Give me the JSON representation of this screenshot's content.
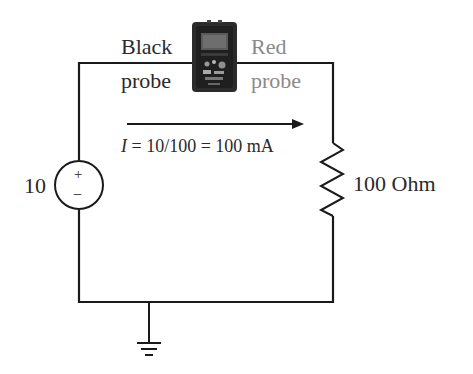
{
  "diagram": {
    "type": "circuit",
    "labels": {
      "black_probe_line1": "Black",
      "black_probe_line2": "probe",
      "red_probe_line1": "Red",
      "red_probe_line2": "probe",
      "source_value": "10",
      "source_plus": "+",
      "source_minus": "−",
      "current_var": "I",
      "current_expr": " = 10/100 = 100 mA",
      "resistor_value": "100 Ohm"
    },
    "components": [
      {
        "id": "voltage-source",
        "kind": "dc-voltage-source",
        "value": "10"
      },
      {
        "id": "resistor",
        "kind": "resistor",
        "value": "100 Ohm"
      },
      {
        "id": "multimeter",
        "kind": "ammeter-multimeter",
        "probes": [
          "Black probe",
          "Red probe"
        ]
      },
      {
        "id": "ground",
        "kind": "ground"
      }
    ],
    "colors": {
      "wire": "#1a1a1a",
      "text": "#2a2a2a",
      "red_probe_text": "#8a8a8a",
      "meter_body": "#2b2b2b"
    }
  }
}
